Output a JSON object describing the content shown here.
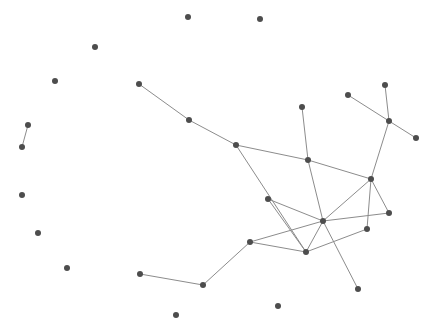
{
  "graph": {
    "width": 438,
    "height": 330,
    "node_color": "#4d4d4d",
    "edge_color": "#8c8c8c",
    "node_radius": 3,
    "nodes": [
      {
        "id": 0,
        "x": 188,
        "y": 17
      },
      {
        "id": 1,
        "x": 260,
        "y": 19
      },
      {
        "id": 2,
        "x": 95,
        "y": 47
      },
      {
        "id": 3,
        "x": 55,
        "y": 81
      },
      {
        "id": 4,
        "x": 139,
        "y": 84
      },
      {
        "id": 5,
        "x": 385,
        "y": 85
      },
      {
        "id": 6,
        "x": 348,
        "y": 95
      },
      {
        "id": 7,
        "x": 302,
        "y": 107
      },
      {
        "id": 8,
        "x": 189,
        "y": 120
      },
      {
        "id": 9,
        "x": 389,
        "y": 121
      },
      {
        "id": 10,
        "x": 28,
        "y": 125
      },
      {
        "id": 11,
        "x": 416,
        "y": 138
      },
      {
        "id": 12,
        "x": 236,
        "y": 145
      },
      {
        "id": 13,
        "x": 22,
        "y": 147
      },
      {
        "id": 14,
        "x": 308,
        "y": 160
      },
      {
        "id": 15,
        "x": 371,
        "y": 179
      },
      {
        "id": 16,
        "x": 22,
        "y": 195
      },
      {
        "id": 17,
        "x": 268,
        "y": 199
      },
      {
        "id": 18,
        "x": 389,
        "y": 213
      },
      {
        "id": 19,
        "x": 323,
        "y": 221
      },
      {
        "id": 20,
        "x": 367,
        "y": 229
      },
      {
        "id": 21,
        "x": 38,
        "y": 233
      },
      {
        "id": 22,
        "x": 250,
        "y": 242
      },
      {
        "id": 23,
        "x": 306,
        "y": 252
      },
      {
        "id": 24,
        "x": 67,
        "y": 268
      },
      {
        "id": 25,
        "x": 140,
        "y": 274
      },
      {
        "id": 26,
        "x": 203,
        "y": 285
      },
      {
        "id": 27,
        "x": 358,
        "y": 289
      },
      {
        "id": 28,
        "x": 278,
        "y": 306
      },
      {
        "id": 29,
        "x": 176,
        "y": 315
      }
    ],
    "edges": [
      [
        10,
        13
      ],
      [
        4,
        8
      ],
      [
        8,
        12
      ],
      [
        12,
        14
      ],
      [
        12,
        23
      ],
      [
        7,
        14
      ],
      [
        14,
        15
      ],
      [
        14,
        19
      ],
      [
        6,
        9
      ],
      [
        5,
        9
      ],
      [
        9,
        11
      ],
      [
        9,
        15
      ],
      [
        15,
        19
      ],
      [
        15,
        18
      ],
      [
        15,
        20
      ],
      [
        17,
        19
      ],
      [
        17,
        23
      ],
      [
        19,
        18
      ],
      [
        19,
        22
      ],
      [
        19,
        23
      ],
      [
        19,
        27
      ],
      [
        22,
        23
      ],
      [
        23,
        20
      ],
      [
        22,
        26
      ],
      [
        25,
        26
      ]
    ]
  }
}
